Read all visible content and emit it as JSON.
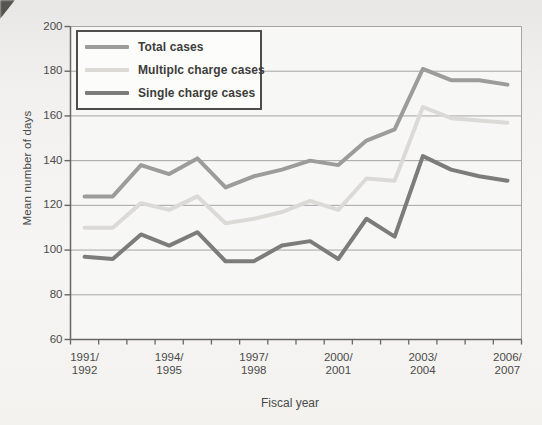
{
  "axes": {
    "y_title": "Mean number of days",
    "x_title": "Fiscal year"
  },
  "legend": {
    "items": [
      {
        "label": "Total cases"
      },
      {
        "label": "Multiplc charge cases"
      },
      {
        "label": "Single charge cases"
      }
    ]
  },
  "chart_data": {
    "type": "line",
    "title": "",
    "xlabel": "Fiscal year",
    "ylabel": "Mean number of days",
    "ylim": [
      60,
      200
    ],
    "yticks": [
      60,
      80,
      100,
      120,
      140,
      160,
      180,
      200
    ],
    "grid": true,
    "legend_position": "top-left-inside",
    "n_categories": 16,
    "x_tick_label_indices": [
      0,
      3,
      6,
      9,
      12,
      15
    ],
    "x_tick_labels": [
      [
        "1991/",
        "1992"
      ],
      [
        "1994/",
        "1995"
      ],
      [
        "1997/",
        "1998"
      ],
      [
        "2000/",
        "2001"
      ],
      [
        "2003/",
        "2004"
      ],
      [
        "2006/",
        "2007"
      ]
    ],
    "series": [
      {
        "name": "Total cases",
        "color": "#9c9c9c",
        "values": [
          124,
          124,
          138,
          134,
          141,
          128,
          133,
          136,
          140,
          138,
          149,
          154,
          181,
          176,
          176,
          174
        ]
      },
      {
        "name": "Multiplc charge cases",
        "color": "#dbdad7",
        "values": [
          110,
          110,
          121,
          118,
          124,
          112,
          114,
          117,
          122,
          118,
          132,
          131,
          164,
          159,
          158,
          157
        ]
      },
      {
        "name": "Single charge cases",
        "color": "#7c7c7c",
        "values": [
          97,
          96,
          107,
          102,
          108,
          95,
          95,
          102,
          104,
          96,
          114,
          106,
          142,
          136,
          133,
          131
        ]
      }
    ],
    "colors": {
      "gridline": "#a6a5a2",
      "axis": "#666664",
      "plot_background": "#f7f7f5",
      "tick_text": "#4b4b4b"
    }
  }
}
